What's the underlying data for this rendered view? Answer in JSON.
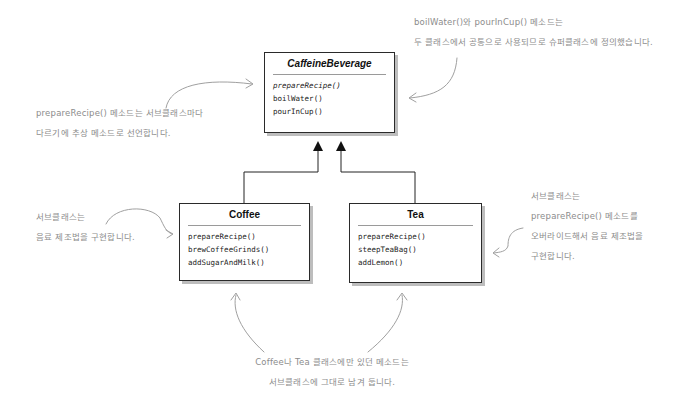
{
  "diagram": {
    "type": "uml-class-diagram",
    "superclass": {
      "name": "CaffeineBeverage",
      "abstract": true,
      "methods": [
        {
          "name": "prepareRecipe()",
          "abstract": true
        },
        {
          "name": "boilWater()",
          "abstract": false
        },
        {
          "name": "pourInCup()",
          "abstract": false
        }
      ]
    },
    "subclasses": [
      {
        "name": "Coffee",
        "methods": [
          {
            "name": "prepareRecipe()"
          },
          {
            "name": "brewCoffeeGrinds()"
          },
          {
            "name": "addSugarAndMilk()"
          }
        ]
      },
      {
        "name": "Tea",
        "methods": [
          {
            "name": "prepareRecipe()"
          },
          {
            "name": "steepTeaBag()"
          },
          {
            "name": "addLemon()"
          }
        ]
      }
    ],
    "relationships": [
      {
        "from": "Coffee",
        "to": "CaffeineBeverage",
        "type": "inheritance"
      },
      {
        "from": "Tea",
        "to": "CaffeineBeverage",
        "type": "inheritance"
      }
    ]
  },
  "annotations": {
    "top_right": {
      "line1": "boilWater()와 pourInCup() 메소드는",
      "line2": "두 클래스에서 공통으로 사용되므로 슈퍼클래스에 정의했습니다."
    },
    "top_left": {
      "line1": "prepareRecipe() 메소드는 서브클래스마다",
      "line2": "다르기에 추상 메소드로 선언합니다."
    },
    "mid_left": {
      "line1": "서브클래스는",
      "line2": "음료 제조법을 구현합니다."
    },
    "mid_right": {
      "line1": "서브클래스는",
      "line2": "prepareRecipe() 메소드를",
      "line3": "오버라이드해서 음료 제조법을",
      "line4": "구현합니다."
    },
    "bottom": {
      "line1": "Coffee나 Tea 클래스에만 있던 메소드는",
      "line2": "서브클래스에 그대로 남겨 둡니다."
    }
  },
  "colors": {
    "box_border": "#2a2a2a",
    "box_shadow": "#bdbdbd",
    "annotation_text": "#8c8c8c",
    "annotation_arrow": "#9a9a9a",
    "inheritance_line": "#222222"
  }
}
